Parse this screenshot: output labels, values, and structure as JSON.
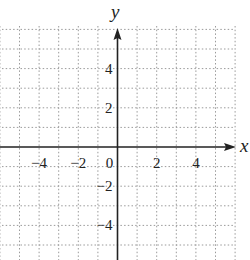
{
  "chart_data": {
    "type": "line",
    "title": "",
    "xlabel": "x",
    "ylabel": "y",
    "xlim": [
      -6,
      6
    ],
    "ylim": [
      -6,
      6
    ],
    "grid": true,
    "grid_style": "dotted",
    "grid_step": 1,
    "x_ticks": [
      {
        "value": -4,
        "label": "−4"
      },
      {
        "value": -2,
        "label": "−2"
      },
      {
        "value": 0,
        "label": "0"
      },
      {
        "value": 2,
        "label": "2"
      },
      {
        "value": 4,
        "label": "4"
      }
    ],
    "y_ticks": [
      {
        "value": 4,
        "label": "4"
      },
      {
        "value": 2,
        "label": "2"
      },
      {
        "value": -2,
        "label": "−2"
      },
      {
        "value": -4,
        "label": "−4"
      }
    ],
    "series": [],
    "legend": null,
    "colors": {
      "axis": "#222222",
      "grid": "#9a9a9a",
      "background": "#ffffff"
    }
  }
}
